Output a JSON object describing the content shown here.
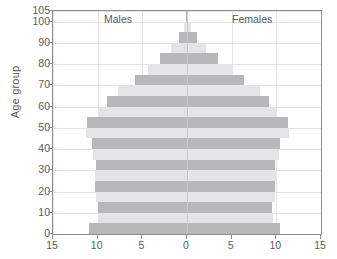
{
  "chart_data": {
    "type": "bar",
    "subtype": "population-pyramid",
    "title": "",
    "xlabel": "",
    "ylabel": "Age group",
    "xlim": [
      -15,
      15
    ],
    "ylim": [
      0,
      105
    ],
    "xticks": [
      "15",
      "10",
      "5",
      "0",
      "5",
      "10",
      "15"
    ],
    "xtick_values": [
      -15,
      -10,
      -5,
      0,
      5,
      10,
      15
    ],
    "yticks": [
      "0",
      "10",
      "20",
      "30",
      "40",
      "50",
      "60",
      "70",
      "80",
      "90",
      "100",
      "105"
    ],
    "ytick_values": [
      0,
      10,
      20,
      30,
      40,
      50,
      60,
      70,
      80,
      90,
      100,
      105
    ],
    "grid": true,
    "legend_position": "inside-top",
    "categories": [
      "0-4",
      "5-9",
      "10-14",
      "15-19",
      "20-24",
      "25-29",
      "30-34",
      "35-39",
      "40-44",
      "45-49",
      "50-54",
      "55-59",
      "60-64",
      "65-69",
      "70-74",
      "75-79",
      "80-84",
      "85-89",
      "90-94",
      "95-99",
      "100-104"
    ],
    "series": [
      {
        "name": "Males",
        "side": "left",
        "values": [
          11.0,
          10.0,
          10.0,
          10.2,
          10.3,
          10.3,
          10.2,
          10.5,
          10.6,
          11.3,
          11.2,
          9.9,
          8.9,
          7.7,
          5.8,
          4.4,
          3.0,
          1.8,
          0.9,
          0.3,
          0.1
        ]
      },
      {
        "name": "Females",
        "side": "right",
        "values": [
          10.4,
          9.6,
          9.5,
          9.8,
          9.9,
          10.0,
          9.9,
          10.3,
          10.4,
          11.4,
          11.3,
          10.1,
          9.2,
          8.2,
          6.4,
          5.0,
          3.5,
          2.1,
          1.1,
          0.4,
          0.1
        ]
      }
    ],
    "colors": {
      "band_light": "#e4e4e6",
      "band_dark": "#b8b8ba",
      "frame": "#8e8e90",
      "grid": "#e2e2e4",
      "text": "#5b5b5d",
      "centerline": "#c9c9cb"
    }
  },
  "axis": {
    "y_title": "Age group"
  },
  "captions": {
    "males": "Males",
    "females": "Females"
  }
}
